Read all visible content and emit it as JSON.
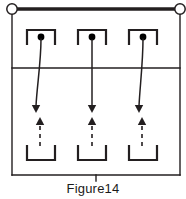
{
  "figure": {
    "caption": "Figure14",
    "title": "Figure14",
    "stroke_color": "#231f20",
    "background_color": "#ffffff",
    "terminal_fill": "#ffffff",
    "dot_fill": "#000000"
  },
  "frame": {
    "left": 12,
    "right": 180,
    "top": 9,
    "bottom": 175,
    "divider_y": 68,
    "top_rail_width": 3.6,
    "border_width": 1.4,
    "bottom_tick": {
      "x": 96,
      "y1": 175,
      "y2": 181
    }
  },
  "terminals": [
    {
      "name": "terminal-left",
      "cx": 12,
      "cy": 9,
      "r": 5.2
    },
    {
      "name": "terminal-right",
      "cx": 180,
      "cy": 9,
      "r": 5.2
    }
  ],
  "top_contacts": [
    {
      "name": "top-contact-1",
      "cx": 41,
      "bracket_half_width": 14,
      "bracket_top": 30,
      "bracket_bottom": 44,
      "dot_cx": 41,
      "dot_cy": 37,
      "dot_r": 3.4
    },
    {
      "name": "top-contact-2",
      "cx": 92,
      "bracket_half_width": 14,
      "bracket_top": 30,
      "bracket_bottom": 44,
      "dot_cx": 92,
      "dot_cy": 37,
      "dot_r": 3.4
    },
    {
      "name": "top-contact-3",
      "cx": 143,
      "bracket_half_width": 14,
      "bracket_top": 30,
      "bracket_bottom": 44,
      "dot_cx": 143,
      "dot_cy": 37,
      "dot_r": 3.4
    }
  ],
  "bottom_brackets": [
    {
      "name": "bottom-bracket-1",
      "cx": 41,
      "half_width": 14,
      "top": 146,
      "bottom": 160
    },
    {
      "name": "bottom-bracket-2",
      "cx": 92,
      "half_width": 14,
      "top": 146,
      "bottom": 160
    },
    {
      "name": "bottom-bracket-3",
      "cx": 143,
      "half_width": 14,
      "top": 146,
      "bottom": 160
    }
  ],
  "solid_arrows": [
    {
      "name": "solid-arrow-1",
      "path": "M 41 39 C 41 62 37 86 36 106",
      "tip_x": 36,
      "tip_y": 113,
      "direction": "down"
    },
    {
      "name": "solid-arrow-2",
      "path": "M 92 40 C 92 64 92 88 92 106",
      "tip_x": 92,
      "tip_y": 113,
      "direction": "down"
    },
    {
      "name": "solid-arrow-3",
      "path": "M 143 39 C 143 62 140 86 139 106",
      "tip_x": 139,
      "tip_y": 113,
      "direction": "down"
    }
  ],
  "dashed_arrows": [
    {
      "name": "dashed-arrow-1",
      "x": 40,
      "y_bottom": 146,
      "y_top": 125,
      "tip_y": 117,
      "direction": "up",
      "dash_pattern": "4,4"
    },
    {
      "name": "dashed-arrow-2",
      "x": 92,
      "y_bottom": 146,
      "y_top": 125,
      "tip_y": 117,
      "direction": "up",
      "dash_pattern": "4,4"
    },
    {
      "name": "dashed-arrow-3",
      "x": 142,
      "y_bottom": 146,
      "y_top": 125,
      "tip_y": 117,
      "direction": "up",
      "dash_pattern": "4,4"
    }
  ]
}
